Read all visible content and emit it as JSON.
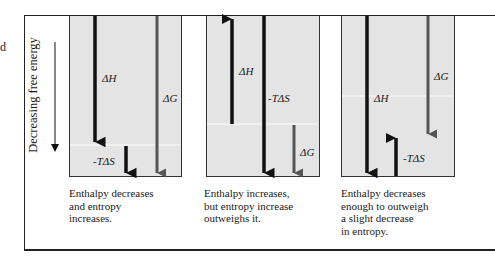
{
  "left_fragment": "d",
  "axis_label": "Decreasing free energy",
  "panels": [
    {
      "labels": {
        "dH": "ΔH",
        "mTdS": "-TΔS",
        "dG": "ΔG"
      },
      "caption": [
        "Enthalpy decreases",
        "and entropy",
        "increases."
      ],
      "dH_direction": "down",
      "mTdS_direction": "down",
      "dG_direction": "down"
    },
    {
      "labels": {
        "dH": "ΔH",
        "mTdS": "-TΔS",
        "dG": "ΔG"
      },
      "caption": [
        "Enthalpy increases,",
        "but entropy increase",
        "outweighs it."
      ],
      "dH_direction": "up",
      "mTdS_direction": "down",
      "dG_direction": "down"
    },
    {
      "labels": {
        "dH": "ΔH",
        "mTdS": "-TΔS",
        "dG": "ΔG"
      },
      "caption": [
        "Enthalpy decreases",
        "enough to outweigh",
        "a slight decrease",
        "in entropy."
      ],
      "dH_direction": "down",
      "mTdS_direction": "up",
      "dG_direction": "down"
    }
  ],
  "colors": {
    "panel_bg": "#e4e4e4",
    "arrow_dark": "#111111",
    "arrow_gray": "#555555"
  }
}
